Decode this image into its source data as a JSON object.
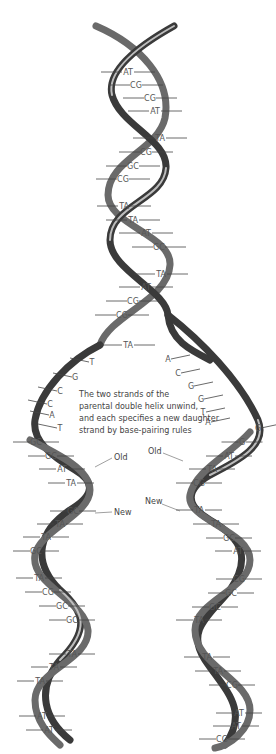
{
  "caption": {
    "lines": [
      "The two strands of the",
      "parental double helix unwind,",
      "and each specifies a new daughter",
      "strand by base-pairing rules"
    ]
  },
  "labels": {
    "old_left": "Old",
    "new_left": "New",
    "old_right": "Old",
    "new_right": "New"
  },
  "parent_helix": {
    "base_pairs": [
      {
        "label": "AT",
        "x": 128,
        "y": 75
      },
      {
        "label": "CG",
        "x": 136,
        "y": 88
      },
      {
        "label": "CG",
        "x": 150,
        "y": 101
      },
      {
        "label": "AT",
        "x": 155,
        "y": 114
      },
      {
        "label": "TA",
        "x": 160,
        "y": 141
      },
      {
        "label": "CG",
        "x": 146,
        "y": 155
      },
      {
        "label": "GC",
        "x": 133,
        "y": 169
      },
      {
        "label": "CG",
        "x": 123,
        "y": 182
      },
      {
        "label": "TA",
        "x": 124,
        "y": 209
      },
      {
        "label": "TA",
        "x": 133,
        "y": 223
      },
      {
        "label": "AT",
        "x": 146,
        "y": 236
      },
      {
        "label": "GC",
        "x": 159,
        "y": 250
      },
      {
        "label": "TA",
        "x": 161,
        "y": 277
      },
      {
        "label": "AT",
        "x": 146,
        "y": 290
      },
      {
        "label": "CG",
        "x": 133,
        "y": 304
      },
      {
        "label": "CG",
        "x": 122,
        "y": 318
      },
      {
        "label": "TA",
        "x": 128,
        "y": 348
      }
    ]
  },
  "unwound_bases": {
    "left": [
      {
        "label": "T",
        "x": 92,
        "y": 365
      },
      {
        "label": "G",
        "x": 75,
        "y": 380
      },
      {
        "label": "C",
        "x": 60,
        "y": 394
      },
      {
        "label": "C",
        "x": 50,
        "y": 407
      },
      {
        "label": "A",
        "x": 52,
        "y": 418
      },
      {
        "label": "T",
        "x": 60,
        "y": 431
      }
    ],
    "right": [
      {
        "label": "A",
        "x": 168,
        "y": 362
      },
      {
        "label": "C",
        "x": 178,
        "y": 376
      },
      {
        "label": "G",
        "x": 191,
        "y": 389
      },
      {
        "label": "G",
        "x": 201,
        "y": 402
      },
      {
        "label": "T",
        "x": 203,
        "y": 415
      },
      {
        "label": "A",
        "x": 208,
        "y": 425
      },
      {
        "label": "G",
        "x": 258,
        "y": 431
      }
    ]
  },
  "daughter_left": {
    "base_pairs": [
      {
        "label": "GC",
        "x": 36,
        "y": 445
      },
      {
        "label": "GC",
        "x": 51,
        "y": 459
      },
      {
        "label": "AT",
        "x": 62,
        "y": 472
      },
      {
        "label": "TA",
        "x": 71,
        "y": 486
      },
      {
        "label": "GC",
        "x": 73,
        "y": 514
      },
      {
        "label": "TA",
        "x": 60,
        "y": 527
      },
      {
        "label": "TA",
        "x": 46,
        "y": 540
      },
      {
        "label": "GC",
        "x": 36,
        "y": 554
      },
      {
        "label": "TA",
        "x": 39,
        "y": 581
      },
      {
        "label": "CG",
        "x": 48,
        "y": 595
      },
      {
        "label": "GC",
        "x": 62,
        "y": 609
      },
      {
        "label": "GC",
        "x": 72,
        "y": 623
      },
      {
        "label": "TA",
        "x": 72,
        "y": 657
      },
      {
        "label": "TA",
        "x": 54,
        "y": 670
      },
      {
        "label": "TA",
        "x": 40,
        "y": 684
      },
      {
        "label": "AT",
        "x": 42,
        "y": 719
      },
      {
        "label": "AT",
        "x": 49,
        "y": 733
      }
    ]
  },
  "daughter_right": {
    "base_pairs": [
      {
        "label": "G",
        "x": 242,
        "y": 445
      },
      {
        "label": "AT",
        "x": 229,
        "y": 459
      },
      {
        "label": "TA",
        "x": 212,
        "y": 472
      },
      {
        "label": "CG",
        "x": 199,
        "y": 486
      },
      {
        "label": "TA",
        "x": 199,
        "y": 513
      },
      {
        "label": "TA",
        "x": 216,
        "y": 527
      },
      {
        "label": "GC",
        "x": 229,
        "y": 541
      },
      {
        "label": "AT",
        "x": 238,
        "y": 554
      },
      {
        "label": "CG",
        "x": 239,
        "y": 582
      },
      {
        "label": "GC",
        "x": 231,
        "y": 596
      },
      {
        "label": "GC",
        "x": 215,
        "y": 610
      },
      {
        "label": "TA",
        "x": 199,
        "y": 623
      },
      {
        "label": "TA",
        "x": 207,
        "y": 660
      },
      {
        "label": "TA",
        "x": 218,
        "y": 674
      },
      {
        "label": "CG",
        "x": 232,
        "y": 688
      },
      {
        "label": "AT",
        "x": 239,
        "y": 716
      },
      {
        "label": "AT",
        "x": 236,
        "y": 729
      },
      {
        "label": "CG",
        "x": 222,
        "y": 742
      }
    ]
  }
}
